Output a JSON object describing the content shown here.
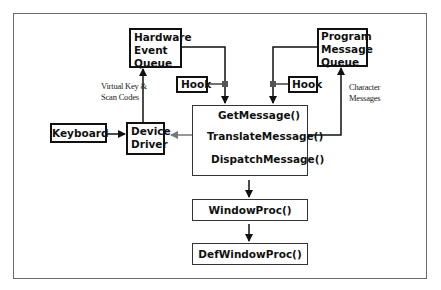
{
  "diagram": {
    "nodes": {
      "hardware_event_queue": {
        "lines": [
          "Hardware",
          "Event",
          "Queue"
        ]
      },
      "program_message_queue": {
        "lines": [
          "Program",
          "Message",
          "Queue"
        ]
      },
      "hook_left": {
        "label": "Hook"
      },
      "hook_right": {
        "label": "Hook"
      },
      "keyboard": {
        "label": "Keyboard"
      },
      "device_driver": {
        "lines": [
          "Device",
          "Driver"
        ]
      },
      "message_loop": {
        "get_message": "GetMessage()",
        "translate_message": "TranslateMessage()",
        "dispatch_message": "DispatchMessage()"
      },
      "window_proc": {
        "label": "WindowProc()"
      },
      "def_window_proc": {
        "label": "DefWindowProc()"
      }
    },
    "annotations": {
      "virtual_key": [
        "Virtual Key &",
        "Scan Codes"
      ],
      "character_messages": [
        "Character",
        "Messages"
      ]
    },
    "edges": [
      {
        "from": "keyboard",
        "to": "device_driver"
      },
      {
        "from": "device_driver",
        "to": "hardware_event_queue",
        "label": "Virtual Key & Scan Codes"
      },
      {
        "from": "hardware_event_queue",
        "to": "get_message",
        "via": "hook_left"
      },
      {
        "from": "program_message_queue",
        "to": "get_message",
        "via": "hook_right"
      },
      {
        "from": "translate_message",
        "to": "device_driver",
        "bidirectional": true
      },
      {
        "from": "translate_message",
        "to": "program_message_queue",
        "label": "Character Messages"
      },
      {
        "from": "message_loop",
        "to": "window_proc"
      },
      {
        "from": "window_proc",
        "to": "def_window_proc"
      }
    ],
    "colors": {
      "line": "#111111",
      "frame": "#6a6a6a",
      "hook_dot": "#555555",
      "bidirectional_arrow": "#777777"
    }
  }
}
